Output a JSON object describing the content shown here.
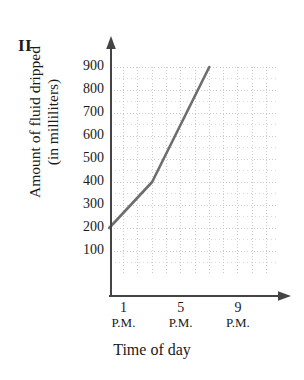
{
  "figure": {
    "label": "II"
  },
  "axis_titles": {
    "y_line1": "Amount of fluid dripped",
    "y_line2": "(in milliliters)",
    "x": "Time of day"
  },
  "chart_data": {
    "type": "line",
    "title": "",
    "xlabel": "Time of day",
    "ylabel": "Amount of fluid dripped (in milliliters)",
    "ylim": [
      0,
      950
    ],
    "xlim": [
      11.3,
      10.6
    ],
    "grid": true,
    "legend": null,
    "y_ticks": [
      900,
      800,
      700,
      600,
      500,
      400,
      300,
      200,
      100
    ],
    "y_tick_labels": [
      "900",
      "800",
      "700",
      "600",
      "500",
      "400",
      "300",
      "200",
      "100"
    ],
    "x_ticks": [
      13,
      17,
      21
    ],
    "x_tick_labels": [
      {
        "hour": "1",
        "meridiem": "P.M."
      },
      {
        "hour": "5",
        "meridiem": "P.M."
      },
      {
        "hour": "9",
        "meridiem": "P.M."
      }
    ],
    "series": [
      {
        "name": "Fluid dripped",
        "color": "#6e6e6e",
        "x": [
          12,
          15,
          19
        ],
        "y": [
          200,
          400,
          900
        ],
        "points": [
          {
            "time": "12 P.M.",
            "value": 200
          },
          {
            "time": "3 P.M.",
            "value": 400
          },
          {
            "time": "7 P.M.",
            "value": 900
          }
        ]
      }
    ],
    "annotations": []
  },
  "colors": {
    "line": "#6e6e6e",
    "axis": "#3b3b3b",
    "grid": "#b9b9b9",
    "text": "#1a1a1a",
    "background": "#ffffff"
  }
}
